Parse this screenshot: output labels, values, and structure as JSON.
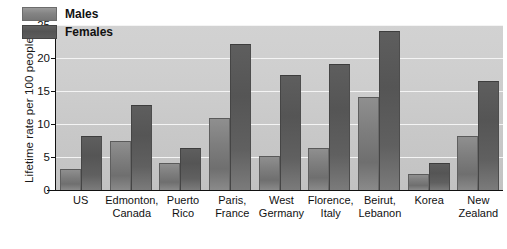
{
  "chart_data": {
    "type": "bar",
    "title": "",
    "xlabel": "",
    "ylabel": "Lifetime rate per 100 people",
    "ylim": [
      0,
      25
    ],
    "yticks": [
      0,
      5,
      10,
      15,
      20,
      25
    ],
    "grid": true,
    "legend_position": "top-left",
    "categories": [
      "US",
      "Edmonton, Canada",
      "Puerto Rico",
      "Paris, France",
      "West Germany",
      "Florence, Italy",
      "Beirut, Lebanon",
      "Korea",
      "New Zealand"
    ],
    "category_lines": [
      {
        "line1": "US",
        "line2": ""
      },
      {
        "line1": "Edmonton,",
        "line2": "Canada"
      },
      {
        "line1": "Puerto",
        "line2": "Rico"
      },
      {
        "line1": "Paris,",
        "line2": "France"
      },
      {
        "line1": "West",
        "line2": "Germany"
      },
      {
        "line1": "Florence,",
        "line2": "Italy"
      },
      {
        "line1": "Beirut,",
        "line2": "Lebanon"
      },
      {
        "line1": "Korea",
        "line2": ""
      },
      {
        "line1": "New",
        "line2": "Zealand"
      }
    ],
    "series": [
      {
        "name": "Males",
        "color": "#7e7e7e",
        "values": [
          3.0,
          7.2,
          4.0,
          10.7,
          5.0,
          6.2,
          14.0,
          2.3,
          8.0
        ]
      },
      {
        "name": "Females",
        "color": "#555555",
        "values": [
          8.1,
          12.8,
          6.2,
          22.0,
          17.3,
          19.0,
          24.0,
          4.0,
          16.3
        ]
      }
    ]
  },
  "legend": {
    "entries": [
      {
        "label": "Males"
      },
      {
        "label": "Females"
      }
    ]
  },
  "colors": {
    "plot_background": "#cdcdcd",
    "gridline": "#f4f4f4",
    "axis": "#111111",
    "page_background": "#ffffff"
  }
}
